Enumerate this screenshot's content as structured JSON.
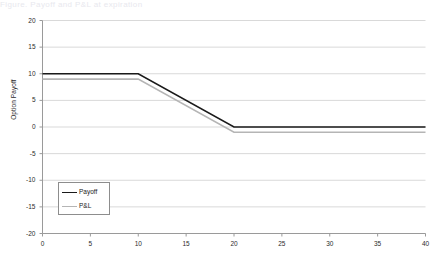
{
  "top_strip_text": "Figure. Payoff and P&L at expiration",
  "chart_data": {
    "type": "line",
    "title": "",
    "xlabel": "",
    "ylabel": "Option Payoff",
    "xlim": [
      0,
      40
    ],
    "ylim": [
      -20,
      20
    ],
    "xticks": [
      0,
      5,
      10,
      15,
      20,
      25,
      30,
      35,
      40
    ],
    "yticks": [
      20,
      15,
      10,
      5,
      0,
      -5,
      -10,
      -15,
      -20
    ],
    "grid": "horizontal",
    "legend_position": "lower-left",
    "series": [
      {
        "name": "Payoff",
        "color": "#1a1a1a",
        "width": 1.6,
        "x": [
          0,
          10,
          20,
          40
        ],
        "values": [
          10,
          10,
          0,
          0
        ]
      },
      {
        "name": "P&L",
        "color": "#b5b5b5",
        "width": 1.6,
        "x": [
          0,
          10,
          20,
          40
        ],
        "values": [
          9,
          9,
          -1,
          -1
        ]
      }
    ]
  },
  "colors": {
    "gridline": "#d9d9d9",
    "axis": "#9a9a9a",
    "background": "#ffffff",
    "legend_border": "#8d8d8d",
    "tick_text": "#2b2b2b"
  },
  "legend": {
    "items": [
      {
        "label": "Payoff"
      },
      {
        "label": "P&L"
      }
    ]
  }
}
